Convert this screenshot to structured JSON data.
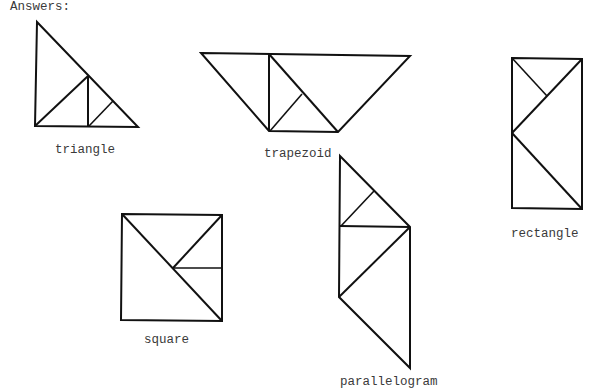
{
  "heading": "Answers:",
  "shapes": {
    "triangle": {
      "label": "triangle"
    },
    "trapezoid": {
      "label": "trapezoid"
    },
    "rectangle": {
      "label": "rectangle"
    },
    "square": {
      "label": "square"
    },
    "parallelogram": {
      "label": "parallelogram"
    }
  },
  "colors": {
    "ink": "#111111",
    "text": "#3a3a3a",
    "background": "#ffffff"
  }
}
